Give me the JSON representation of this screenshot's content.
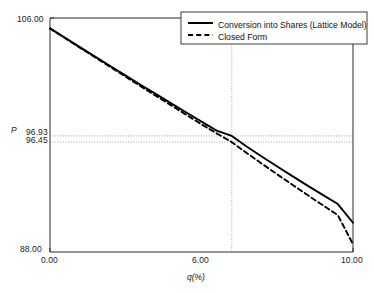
{
  "chart_data": {
    "type": "line",
    "title": "",
    "xlabel": "q(%)",
    "ylabel": "P",
    "xlim": [
      0.0,
      10.0
    ],
    "ylim": [
      88.0,
      106.0
    ],
    "xticks": [
      0.0,
      6.0,
      10.0
    ],
    "xtick_labels": [
      "0.00",
      "6.00",
      "10.00"
    ],
    "yticks": [
      88.0,
      96.45,
      96.93,
      106.0
    ],
    "ytick_labels": [
      "88.00",
      "96.45",
      "96.93",
      "106.00"
    ],
    "grid": false,
    "reference_lines": {
      "horizontal": [
        96.93,
        96.45
      ],
      "vertical": [
        6.0
      ],
      "style": "dotted"
    },
    "legend_position": "top-right",
    "series": [
      {
        "name": "Conversion into Shares (Lattice Model)",
        "style": "solid",
        "color": "#000000",
        "x": [
          0.0,
          0.5,
          1.0,
          1.5,
          2.0,
          2.5,
          3.0,
          3.5,
          4.0,
          4.5,
          5.0,
          5.5,
          6.0,
          6.5,
          7.0,
          7.5,
          8.0,
          8.5,
          9.0,
          9.5,
          10.0
        ],
        "y": [
          105.2,
          104.47,
          103.74,
          103.01,
          102.29,
          101.57,
          100.85,
          100.14,
          99.43,
          98.73,
          98.03,
          97.34,
          96.93,
          96.1,
          95.33,
          94.58,
          93.84,
          93.11,
          92.39,
          91.69,
          90.25
        ]
      },
      {
        "name": "Closed Form",
        "style": "dashed",
        "color": "#000000",
        "x": [
          0.0,
          0.5,
          1.0,
          1.5,
          2.0,
          2.5,
          3.0,
          3.5,
          4.0,
          4.5,
          5.0,
          5.5,
          6.0,
          6.5,
          7.0,
          7.5,
          8.0,
          8.5,
          9.0,
          9.5,
          10.0
        ],
        "y": [
          105.2,
          104.45,
          103.7,
          102.96,
          102.22,
          101.48,
          100.74,
          100.01,
          99.28,
          98.55,
          97.82,
          97.13,
          96.45,
          95.6,
          94.78,
          93.97,
          93.17,
          92.38,
          91.6,
          90.83,
          88.6
        ]
      }
    ]
  },
  "legend": {
    "items": [
      {
        "label": "Conversion into Shares (Lattice Model)",
        "style": "solid"
      },
      {
        "label": "Closed Form",
        "style": "dashed"
      }
    ]
  },
  "axes": {
    "y_title": "P",
    "x_title": "q(%)",
    "y_tick_top": "106.00",
    "y_tick_mid_upper": "96.93",
    "y_tick_mid_lower": "96.45",
    "y_tick_bottom": "88.00",
    "x_tick_left": "0.00",
    "x_tick_mid": "6.00",
    "x_tick_right": "10.00"
  },
  "colors": {
    "line": "#000000",
    "axis": "#2b2b2b",
    "grid": "#9a9a9a",
    "background": "#ffffff"
  }
}
